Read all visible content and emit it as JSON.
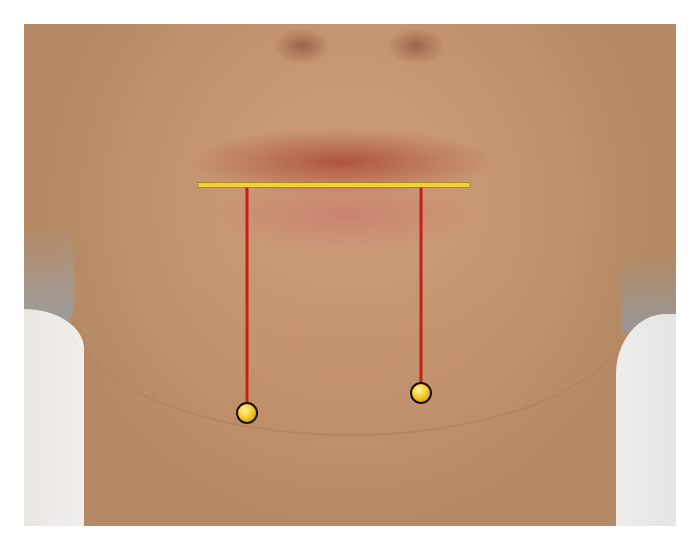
{
  "image": {
    "subject": "lower face photograph with measurement overlay",
    "frame": {
      "x": 24,
      "y": 24,
      "width": 652,
      "height": 502
    },
    "background_color": "#ffffff"
  },
  "overlay": {
    "horizontal_line": {
      "x1": 198,
      "x2": 470,
      "y": 185,
      "color": "#f2d13a",
      "stroke": 5
    },
    "vertical_lines": [
      {
        "x": 247,
        "y1": 187,
        "y2": 412,
        "color": "#c81e14",
        "stroke": 3
      },
      {
        "x": 421,
        "y1": 187,
        "y2": 392,
        "color": "#c81e14",
        "stroke": 3
      }
    ],
    "markers": [
      {
        "cx": 247,
        "cy": 413,
        "r": 10,
        "fill": "#f7cd35",
        "outline": "#1a1206"
      },
      {
        "cx": 421,
        "cy": 393,
        "r": 10,
        "fill": "#f7cd35",
        "outline": "#1a1206"
      }
    ]
  }
}
